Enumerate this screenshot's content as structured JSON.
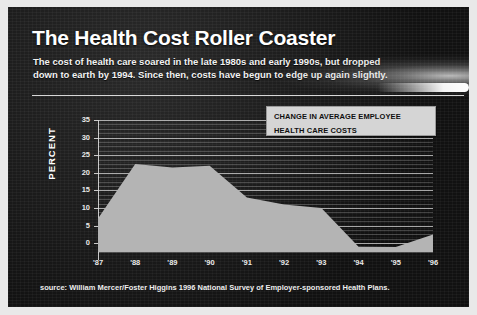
{
  "header": {
    "title": "The Health Cost Roller Coaster",
    "subtitle_line1": "The cost of health care soared in the late 1980s and early 1990s, but dropped",
    "subtitle_line2": "down to earth by 1994.  Since then, costs have begun to edge up again slightly."
  },
  "legend": {
    "line1": "CHANGE IN AVERAGE  EMPLOYEE",
    "line2": "HEALTH CARE COSTS"
  },
  "source": "source:  William Mercer/Foster Higgins 1996 National Survey of Employer-sponsored Health Plans.",
  "colors": {
    "panel_background": "#1b1b1b",
    "frame": "#e9e9e9",
    "area_fill": "#b4b4b4",
    "gridline": "#e1e1e1",
    "text": "#ffffff",
    "legend_background": "#d5d5d5"
  },
  "chart_data": {
    "type": "area",
    "title": "The Health Cost Roller Coaster",
    "xlabel": "",
    "ylabel": "PERCENT",
    "x": [
      "'87",
      "'88",
      "'89",
      "'90",
      "'91",
      "'92",
      "'93",
      "'94",
      "'95",
      "'96"
    ],
    "categories": [
      "'87",
      "'88",
      "'89",
      "'90",
      "'91",
      "'92",
      "'93",
      "'94",
      "'95",
      "'96"
    ],
    "values": [
      7,
      22.5,
      21.5,
      22,
      13,
      11,
      10,
      -1,
      -1.1,
      2.5
    ],
    "series": [
      {
        "name": "CHANGE IN AVERAGE  EMPLOYEE HEALTH CARE COSTS",
        "values": [
          7,
          22.5,
          21.5,
          22,
          13,
          11,
          10,
          -1,
          -1.1,
          2.5
        ]
      }
    ],
    "ylim": [
      -2.5,
      35
    ],
    "yticks": [
      35,
      30,
      25,
      20,
      15,
      10,
      5,
      0
    ],
    "ytick_labels": [
      "35",
      "30",
      "25",
      "20",
      "15",
      "10",
      "5",
      "0"
    ],
    "minor_gridlines": true,
    "grid": true,
    "legend_position": "top-right"
  }
}
